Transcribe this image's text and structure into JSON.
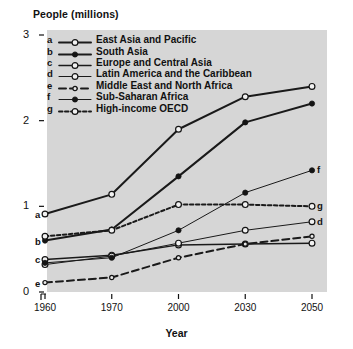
{
  "chart_data": {
    "type": "line",
    "title": "",
    "ylabel": "People (millions)",
    "xlabel": "Year",
    "x": [
      1960,
      1970,
      2000,
      2030,
      2050
    ],
    "xtick_labels": [
      "1960",
      "1970",
      "2000",
      "2030",
      "2050"
    ],
    "ytick_labels": [
      "0",
      "1",
      "2",
      "3"
    ],
    "yticks": [
      0,
      1,
      2,
      3
    ],
    "ylim": [
      0,
      3
    ],
    "grid": false,
    "legend_position": "top-left-inside",
    "plot_background": "#d6d6d6",
    "series": [
      {
        "key": "a",
        "name": "East Asia and Pacific",
        "values": [
          0.91,
          1.14,
          1.9,
          2.28,
          2.4
        ],
        "marker": "open-circle",
        "line": "solid",
        "width": "thick"
      },
      {
        "key": "b",
        "name": "South Asia",
        "values": [
          0.6,
          0.73,
          1.35,
          1.98,
          2.2
        ],
        "marker": "filled-circle",
        "line": "solid",
        "width": "thick"
      },
      {
        "key": "c",
        "name": "Europe and Central Asia",
        "values": [
          0.38,
          0.43,
          0.55,
          0.56,
          0.57
        ],
        "marker": "open-circle",
        "line": "solid",
        "width": "medium"
      },
      {
        "key": "d",
        "name": "Latin America and the Caribbean",
        "values": [
          0.32,
          0.42,
          0.57,
          0.72,
          0.82
        ],
        "marker": "open-circle",
        "line": "solid",
        "width": "thin"
      },
      {
        "key": "e",
        "name": "Middle East and North Africa",
        "values": [
          0.11,
          0.17,
          0.4,
          0.56,
          0.65
        ],
        "marker": "small-open-circle",
        "line": "dashed-long",
        "width": "thick"
      },
      {
        "key": "f",
        "name": "Sub-Saharan Africa",
        "values": [
          0.34,
          0.4,
          0.72,
          1.16,
          1.42
        ],
        "marker": "filled-circle",
        "line": "solid",
        "width": "thin"
      },
      {
        "key": "g",
        "name": "High-income OECD",
        "values": [
          0.65,
          0.72,
          1.02,
          1.02,
          1.0
        ],
        "marker": "open-circle",
        "line": "dashed-short",
        "width": "thick"
      }
    ]
  }
}
